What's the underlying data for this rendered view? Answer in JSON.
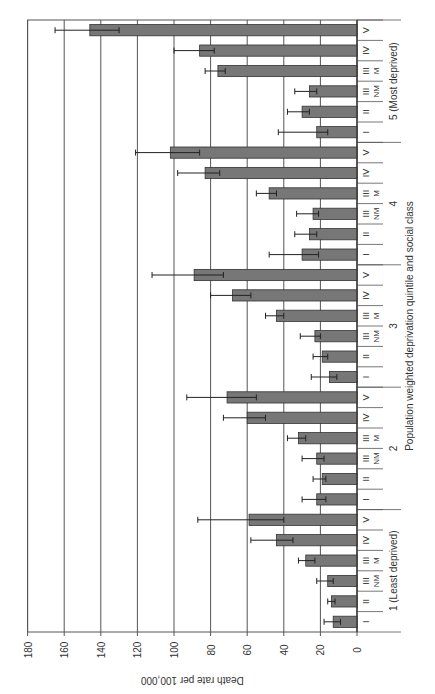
{
  "chart_data": {
    "type": "bar",
    "orientation": "rotated-90",
    "title": "",
    "ylabel": "Death rate per 100,000",
    "xlabel": "Population weighted deprivation quintile and social class",
    "ylim": [
      0,
      180
    ],
    "yticks": [
      0,
      20,
      40,
      60,
      80,
      100,
      120,
      140,
      160,
      180
    ],
    "grid": true,
    "groups": [
      {
        "label": "1 (Least deprived)",
        "classes": [
          "I",
          "II",
          "III NM",
          "III M",
          "IV",
          "V"
        ],
        "values": [
          13,
          14,
          16,
          28,
          44,
          59
        ],
        "ci_low": [
          9,
          12,
          13,
          23,
          35,
          40
        ],
        "ci_high": [
          18,
          16,
          22,
          32,
          58,
          87
        ]
      },
      {
        "label": "2",
        "classes": [
          "I",
          "II",
          "III NM",
          "III M",
          "IV",
          "V"
        ],
        "values": [
          22,
          19,
          22,
          32,
          60,
          71
        ],
        "ci_low": [
          17,
          17,
          18,
          28,
          50,
          55
        ],
        "ci_high": [
          30,
          24,
          30,
          38,
          73,
          93
        ]
      },
      {
        "label": "3",
        "classes": [
          "I",
          "II",
          "III NM",
          "III M",
          "IV",
          "V"
        ],
        "values": [
          15,
          19,
          23,
          44,
          68,
          89
        ],
        "ci_low": [
          11,
          16,
          20,
          40,
          58,
          73
        ],
        "ci_high": [
          25,
          24,
          31,
          50,
          80,
          112
        ]
      },
      {
        "label": "4",
        "classes": [
          "I",
          "II",
          "III NM",
          "III M",
          "IV",
          "V"
        ],
        "values": [
          30,
          26,
          24,
          48,
          83,
          102
        ],
        "ci_low": [
          21,
          22,
          21,
          44,
          75,
          86
        ],
        "ci_high": [
          48,
          34,
          33,
          55,
          98,
          121
        ]
      },
      {
        "label": "5 (Most deprived)",
        "classes": [
          "I",
          "II",
          "III NM",
          "III M",
          "IV",
          "V"
        ],
        "values": [
          22,
          30,
          26,
          76,
          86,
          146
        ],
        "ci_low": [
          16,
          26,
          22,
          72,
          78,
          130
        ],
        "ci_high": [
          43,
          38,
          34,
          83,
          100,
          165
        ]
      }
    ],
    "bar_color": "#777777"
  }
}
